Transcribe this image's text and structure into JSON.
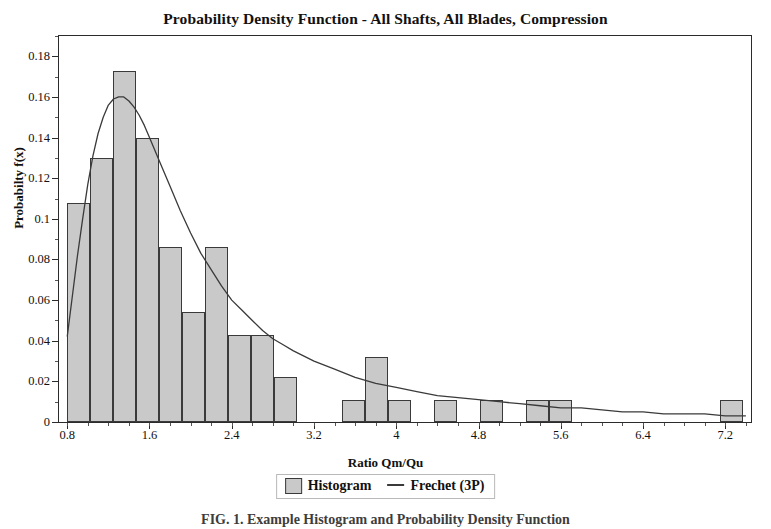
{
  "chart_data": {
    "type": "bar",
    "title": "Probability Density Function - All Shafts, All Blades, Compression",
    "xlabel": "Ratio Qm/Qu",
    "ylabel": "Probabilty f(x)",
    "xlim": [
      0.72,
      7.45
    ],
    "ylim": [
      0,
      0.19
    ],
    "grid": false,
    "legend_position": "bottom-center",
    "xticks": [
      0.8,
      1.6,
      2.4,
      3.2,
      4.0,
      4.8,
      5.6,
      6.4,
      7.2
    ],
    "xtick_labels": [
      "0.8",
      "1.6",
      "2.4",
      "3.2",
      "4",
      "4.8",
      "5.6",
      "6.4",
      "7.2"
    ],
    "yticks": [
      0,
      0.02,
      0.04,
      0.06,
      0.08,
      0.1,
      0.12,
      0.14,
      0.16,
      0.18
    ],
    "ytick_labels": [
      "0",
      "0.02",
      "0.04",
      "0.06",
      "0.08",
      "0.1",
      "0.12",
      "0.14",
      "0.16",
      "0.18"
    ],
    "bin_width": 0.223,
    "series": [
      {
        "name": "Histogram",
        "type": "bar",
        "color": "#c9c9c9",
        "edge_color": "#3a3a3a",
        "bins": [
          {
            "x0": 0.8,
            "x1": 1.023,
            "value": 0.108
          },
          {
            "x0": 1.023,
            "x1": 1.246,
            "value": 0.13
          },
          {
            "x0": 1.246,
            "x1": 1.469,
            "value": 0.173
          },
          {
            "x0": 1.469,
            "x1": 1.692,
            "value": 0.14
          },
          {
            "x0": 1.692,
            "x1": 1.915,
            "value": 0.086
          },
          {
            "x0": 1.915,
            "x1": 2.138,
            "value": 0.054
          },
          {
            "x0": 2.138,
            "x1": 2.361,
            "value": 0.086
          },
          {
            "x0": 2.361,
            "x1": 2.584,
            "value": 0.043
          },
          {
            "x0": 2.584,
            "x1": 2.807,
            "value": 0.043
          },
          {
            "x0": 2.807,
            "x1": 3.03,
            "value": 0.022
          },
          {
            "x0": 3.476,
            "x1": 3.699,
            "value": 0.011
          },
          {
            "x0": 3.699,
            "x1": 3.922,
            "value": 0.032
          },
          {
            "x0": 3.922,
            "x1": 4.145,
            "value": 0.011
          },
          {
            "x0": 4.368,
            "x1": 4.591,
            "value": 0.011
          },
          {
            "x0": 4.814,
            "x1": 5.037,
            "value": 0.011
          },
          {
            "x0": 5.26,
            "x1": 5.483,
            "value": 0.011
          },
          {
            "x0": 5.483,
            "x1": 5.706,
            "value": 0.011
          },
          {
            "x0": 7.152,
            "x1": 7.375,
            "value": 0.011
          }
        ]
      },
      {
        "name": "Frechet (3P)",
        "type": "line",
        "color": "#3a3a3a",
        "peak_x": 1.35,
        "peak_y": 0.16,
        "points": [
          [
            0.8,
            0.042
          ],
          [
            0.85,
            0.062
          ],
          [
            0.9,
            0.082
          ],
          [
            0.95,
            0.1
          ],
          [
            1.0,
            0.117
          ],
          [
            1.05,
            0.131
          ],
          [
            1.1,
            0.142
          ],
          [
            1.15,
            0.15
          ],
          [
            1.2,
            0.156
          ],
          [
            1.25,
            0.159
          ],
          [
            1.3,
            0.16
          ],
          [
            1.35,
            0.16
          ],
          [
            1.4,
            0.158
          ],
          [
            1.45,
            0.155
          ],
          [
            1.5,
            0.151
          ],
          [
            1.55,
            0.146
          ],
          [
            1.6,
            0.14
          ],
          [
            1.7,
            0.128
          ],
          [
            1.8,
            0.116
          ],
          [
            1.9,
            0.104
          ],
          [
            2.0,
            0.093
          ],
          [
            2.1,
            0.083
          ],
          [
            2.2,
            0.075
          ],
          [
            2.3,
            0.067
          ],
          [
            2.4,
            0.06
          ],
          [
            2.5,
            0.055
          ],
          [
            2.6,
            0.05
          ],
          [
            2.7,
            0.045
          ],
          [
            2.8,
            0.041
          ],
          [
            2.9,
            0.038
          ],
          [
            3.0,
            0.035
          ],
          [
            3.2,
            0.03
          ],
          [
            3.4,
            0.026
          ],
          [
            3.6,
            0.022
          ],
          [
            3.8,
            0.019
          ],
          [
            4.0,
            0.017
          ],
          [
            4.2,
            0.015
          ],
          [
            4.4,
            0.013
          ],
          [
            4.6,
            0.012
          ],
          [
            4.8,
            0.011
          ],
          [
            5.0,
            0.01
          ],
          [
            5.2,
            0.009
          ],
          [
            5.4,
            0.008
          ],
          [
            5.6,
            0.007
          ],
          [
            5.8,
            0.007
          ],
          [
            6.0,
            0.006
          ],
          [
            6.2,
            0.005
          ],
          [
            6.4,
            0.005
          ],
          [
            6.6,
            0.004
          ],
          [
            6.8,
            0.004
          ],
          [
            7.0,
            0.004
          ],
          [
            7.2,
            0.003
          ],
          [
            7.4,
            0.003
          ]
        ]
      }
    ]
  },
  "legend": {
    "items": [
      {
        "label": "Histogram",
        "marker": "swatch"
      },
      {
        "label": "Frechet (3P)",
        "marker": "line"
      }
    ]
  },
  "caption": {
    "text": "FIG. 1. Example Histogram and Probability Density Function"
  }
}
